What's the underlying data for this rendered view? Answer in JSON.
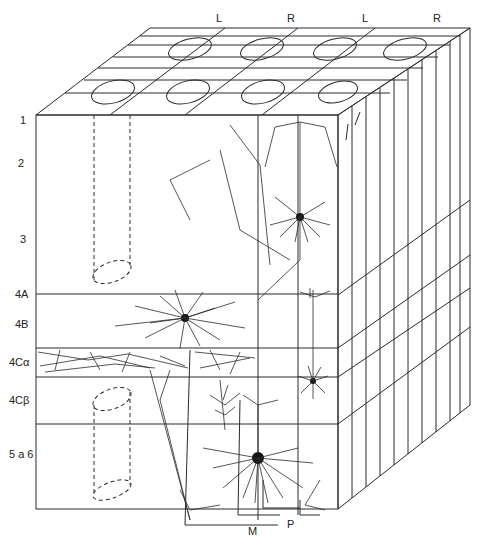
{
  "figure": {
    "column_labels": [
      "L",
      "R",
      "L",
      "R"
    ],
    "layer_labels": [
      "1",
      "2",
      "3",
      "4A",
      "4B",
      "4Cα",
      "4Cβ",
      "5 a 6"
    ],
    "pathway_labels": [
      "M",
      "P"
    ],
    "colors": {
      "ink": "#2a2a2a",
      "background": "#ffffff"
    }
  }
}
